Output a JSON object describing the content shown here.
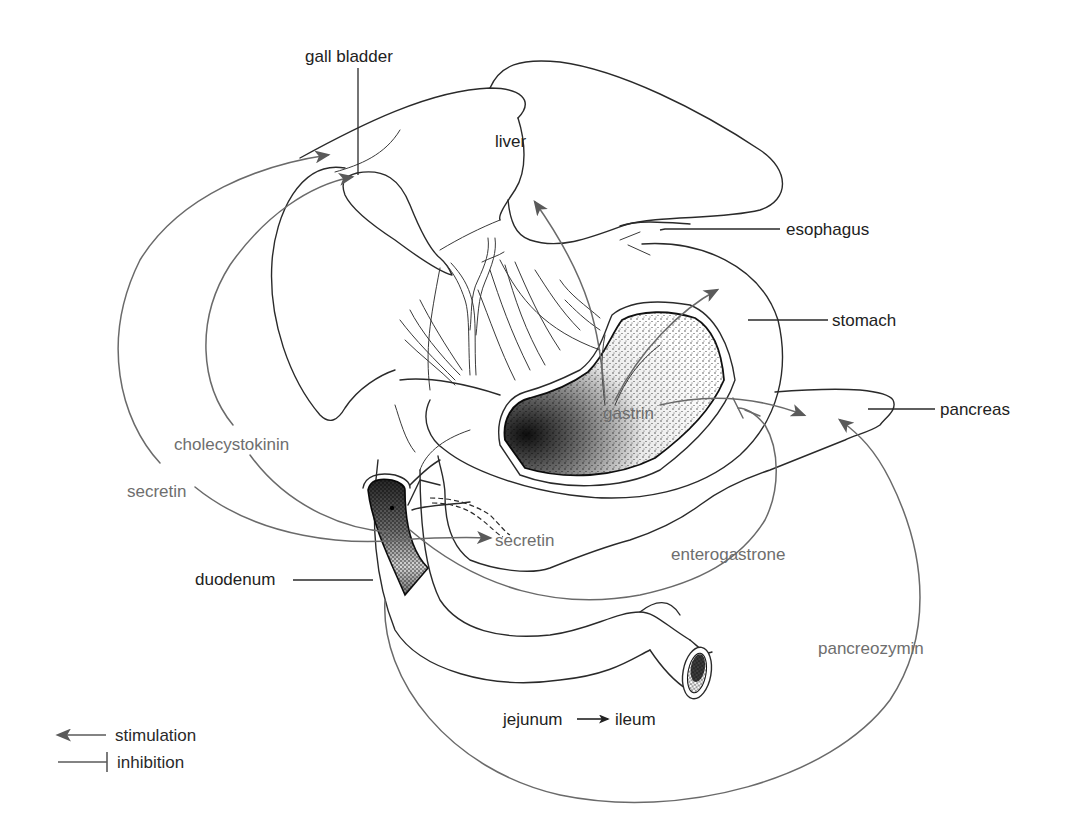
{
  "diagram": {
    "colors": {
      "outline": "#2a2a2a",
      "hormone_path": "#6a6a6a",
      "hormone_label": "#6e6e6e",
      "arrowhead": "#5a5a5a",
      "stipple_dark": "#111111",
      "background": "#ffffff"
    },
    "organ_labels": {
      "gall_bladder": "gall bladder",
      "liver": "liver",
      "esophagus": "esophagus",
      "stomach": "stomach",
      "pancreas": "pancreas",
      "duodenum": "duodenum",
      "jejunum": "jejunum",
      "ileum": "ileum"
    },
    "hormone_labels": {
      "cholecystokinin": "cholecystokinin",
      "secretin_left": "secretin",
      "secretin_pancreas": "secretin",
      "gastrin": "gastrin",
      "enterogastrone": "enterogastrone",
      "pancreozymin": "pancreozymin"
    },
    "pathways": [
      {
        "hormone": "secretin",
        "from": "duodenum",
        "to": "liver",
        "effect": "stimulation"
      },
      {
        "hormone": "cholecystokinin",
        "from": "duodenum",
        "to": "gall bladder",
        "effect": "stimulation"
      },
      {
        "hormone": "secretin",
        "from": "duodenum",
        "to": "pancreas",
        "effect": "stimulation"
      },
      {
        "hormone": "gastrin",
        "from": "stomach",
        "to": "liver",
        "effect": "stimulation"
      },
      {
        "hormone": "gastrin",
        "from": "stomach",
        "to": "stomach",
        "effect": "stimulation"
      },
      {
        "hormone": "gastrin",
        "from": "stomach",
        "to": "pancreas",
        "effect": "stimulation"
      },
      {
        "hormone": "enterogastrone",
        "from": "duodenum",
        "to": "stomach",
        "effect": "inhibition"
      },
      {
        "hormone": "pancreozymin",
        "from": "duodenum",
        "to": "pancreas",
        "effect": "stimulation"
      }
    ],
    "legend": {
      "stimulation": "stimulation",
      "inhibition": "inhibition"
    }
  }
}
